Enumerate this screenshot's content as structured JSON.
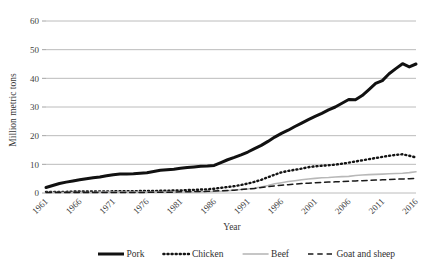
{
  "chart_data": {
    "type": "line",
    "title": "",
    "xlabel": "Year",
    "ylabel": "Million metric tons",
    "xlim": [
      1961,
      2016
    ],
    "ylim": [
      0,
      60
    ],
    "ytick_step": 10,
    "yticks": [
      "0",
      "10",
      "20",
      "30",
      "40",
      "50",
      "60"
    ],
    "xticks": [
      "1961",
      "1966",
      "1971",
      "1976",
      "1981",
      "1986",
      "1991",
      "1996",
      "2001",
      "2006",
      "2011",
      "2016"
    ],
    "grid": "horizontal",
    "legend_position": "bottom",
    "x": [
      1961,
      1962,
      1963,
      1964,
      1965,
      1966,
      1967,
      1968,
      1969,
      1970,
      1971,
      1972,
      1973,
      1974,
      1975,
      1976,
      1977,
      1978,
      1979,
      1980,
      1981,
      1982,
      1983,
      1984,
      1985,
      1986,
      1987,
      1988,
      1989,
      1990,
      1991,
      1992,
      1993,
      1994,
      1995,
      1996,
      1997,
      1998,
      1999,
      2000,
      2001,
      2002,
      2003,
      2004,
      2005,
      2006,
      2007,
      2008,
      2009,
      2010,
      2011,
      2012,
      2013,
      2014,
      2015,
      2016
    ],
    "series": [
      {
        "name": "Pork",
        "color": "#111111",
        "style": "solid",
        "width": 3.0,
        "values": [
          1.9,
          2.6,
          3.3,
          3.8,
          4.2,
          4.6,
          5.0,
          5.3,
          5.6,
          6.0,
          6.4,
          6.6,
          6.6,
          6.7,
          6.9,
          7.1,
          7.5,
          7.9,
          8.1,
          8.3,
          8.6,
          8.9,
          9.1,
          9.3,
          9.4,
          9.6,
          10.6,
          11.6,
          12.4,
          13.3,
          14.3,
          15.5,
          16.6,
          18.0,
          19.5,
          20.8,
          21.9,
          23.2,
          24.4,
          25.6,
          26.7,
          27.8,
          29.0,
          30.0,
          31.3,
          32.6,
          32.5,
          34.0,
          36.1,
          38.2,
          39.2,
          41.6,
          43.4,
          45.1,
          44.0,
          45.0
        ]
      },
      {
        "name": "Chicken",
        "color": "#141414",
        "style": "dotted",
        "width": 2.4,
        "values": [
          0.4,
          0.4,
          0.4,
          0.4,
          0.5,
          0.5,
          0.5,
          0.5,
          0.5,
          0.5,
          0.6,
          0.6,
          0.6,
          0.6,
          0.7,
          0.7,
          0.7,
          0.8,
          0.8,
          0.9,
          0.9,
          1.0,
          1.1,
          1.2,
          1.3,
          1.5,
          1.8,
          2.1,
          2.4,
          2.8,
          3.3,
          3.9,
          4.6,
          5.5,
          6.4,
          7.2,
          7.7,
          8.1,
          8.5,
          9.0,
          9.3,
          9.5,
          9.7,
          9.9,
          10.2,
          10.6,
          11.0,
          11.4,
          11.8,
          12.2,
          12.6,
          13.0,
          13.3,
          13.5,
          13.0,
          12.4
        ]
      },
      {
        "name": "Beef",
        "color": "#b8b8b8",
        "style": "solid",
        "width": 1.6,
        "values": [
          0.2,
          0.2,
          0.2,
          0.2,
          0.2,
          0.2,
          0.2,
          0.2,
          0.3,
          0.3,
          0.3,
          0.3,
          0.3,
          0.3,
          0.3,
          0.3,
          0.3,
          0.3,
          0.3,
          0.3,
          0.3,
          0.3,
          0.3,
          0.4,
          0.4,
          0.5,
          0.6,
          0.8,
          1.0,
          1.2,
          1.4,
          1.7,
          2.1,
          2.6,
          3.2,
          3.6,
          4.0,
          4.3,
          4.6,
          4.9,
          5.1,
          5.3,
          5.4,
          5.6,
          5.7,
          5.8,
          6.1,
          6.3,
          6.4,
          6.5,
          6.6,
          6.7,
          6.8,
          6.9,
          7.1,
          7.4
        ]
      },
      {
        "name": "Goat and sheep",
        "color": "#1a1a1a",
        "style": "dashed",
        "width": 1.5,
        "values": [
          0.2,
          0.2,
          0.2,
          0.2,
          0.2,
          0.2,
          0.2,
          0.2,
          0.2,
          0.2,
          0.2,
          0.2,
          0.2,
          0.2,
          0.2,
          0.2,
          0.3,
          0.3,
          0.3,
          0.3,
          0.4,
          0.4,
          0.5,
          0.5,
          0.6,
          0.7,
          0.8,
          0.9,
          1.0,
          1.2,
          1.4,
          1.6,
          1.9,
          2.2,
          2.5,
          2.7,
          2.9,
          3.1,
          3.3,
          3.4,
          3.6,
          3.7,
          3.8,
          3.9,
          4.0,
          4.1,
          4.2,
          4.3,
          4.4,
          4.5,
          4.6,
          4.7,
          4.8,
          4.9,
          5.0,
          5.1
        ]
      }
    ]
  },
  "legend": {
    "items": [
      {
        "label": "Pork"
      },
      {
        "label": "Chicken"
      },
      {
        "label": "Beef"
      },
      {
        "label": "Goat and sheep"
      }
    ]
  }
}
